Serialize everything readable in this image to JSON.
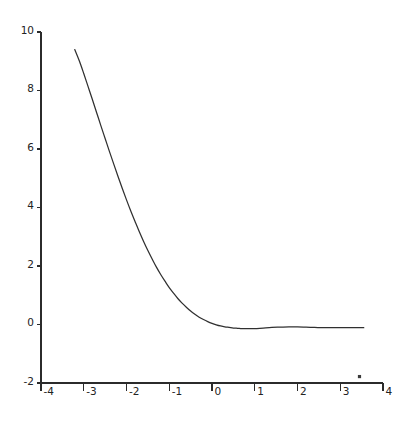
{
  "chart_data": {
    "type": "line",
    "title": "",
    "subtitle": "",
    "xlabel": "",
    "ylabel": "",
    "xlim": [
      -4,
      4
    ],
    "ylim": [
      -2,
      10
    ],
    "grid": false,
    "legend": null,
    "xticks": [
      -4,
      -3,
      -2,
      -1,
      0,
      1,
      2,
      3,
      4
    ],
    "xticklabels": [
      "-4",
      "-3",
      "-2",
      "-1",
      "0",
      "1",
      "2",
      "3",
      "4"
    ],
    "yticks": [
      -2,
      0,
      2,
      4,
      6,
      8,
      10
    ],
    "yticklabels": [
      "-2",
      "0",
      "2",
      "4",
      "6",
      "8",
      "10"
    ],
    "series": [
      {
        "name": "decay",
        "x": [
          -3.21,
          -3.1,
          -3.0,
          -2.9,
          -2.8,
          -2.7,
          -2.6,
          -2.5,
          -2.4,
          -2.3,
          -2.2,
          -2.1,
          -2.0,
          -1.9,
          -1.8,
          -1.7,
          -1.6,
          -1.5,
          -1.4,
          -1.3,
          -1.2,
          -1.1,
          -1.0,
          -0.9,
          -0.8,
          -0.7,
          -0.6,
          -0.5,
          -0.4,
          -0.3,
          -0.2,
          -0.1,
          0.0,
          0.1,
          0.2,
          0.3,
          0.4,
          0.5,
          0.6,
          0.7,
          0.8,
          0.9,
          1.0,
          1.2,
          1.4,
          1.6,
          1.8,
          2.0,
          2.2,
          2.4,
          2.6,
          2.8,
          3.0,
          3.2,
          3.4,
          3.55
        ],
        "y": [
          9.4,
          9.0,
          8.58,
          8.14,
          7.7,
          7.25,
          6.8,
          6.36,
          5.92,
          5.49,
          5.07,
          4.66,
          4.26,
          3.88,
          3.52,
          3.17,
          2.84,
          2.53,
          2.24,
          1.96,
          1.71,
          1.48,
          1.26,
          1.07,
          0.89,
          0.73,
          0.59,
          0.46,
          0.35,
          0.25,
          0.17,
          0.1,
          0.04,
          -0.01,
          -0.05,
          -0.08,
          -0.1,
          -0.12,
          -0.13,
          -0.14,
          -0.14,
          -0.14,
          -0.14,
          -0.12,
          -0.1,
          -0.09,
          -0.08,
          -0.08,
          -0.09,
          -0.1,
          -0.11,
          -0.11,
          -0.11,
          -0.11,
          -0.11,
          -0.11
        ]
      }
    ],
    "annotations": [
      {
        "name": "speck",
        "x": 3.45,
        "y": -1.78
      }
    ]
  },
  "axes": {
    "left_spine": true,
    "bottom_spine": true,
    "top_spine": false,
    "right_spine": false,
    "tick_direction": "out"
  },
  "colors": {
    "line": "#303030",
    "axis": "#2b2b2b",
    "text": "#232323",
    "background": "#ffffff"
  }
}
